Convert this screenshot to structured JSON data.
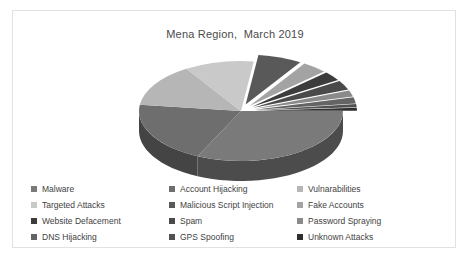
{
  "chart_data": {
    "type": "pie",
    "title": "Mena Region,  March 2019",
    "xlabel": "",
    "ylabel": "",
    "legend_position": "bottom",
    "three_d": true,
    "exploded": true,
    "categories": [
      "Malware",
      "Account Hijacking",
      "Vulnarabilities",
      "Targeted Attacks",
      "Malicious Script Injection",
      "Fake Accounts",
      "Website Defacement",
      "Spam",
      "Password Spraying",
      "DNS Hijacking",
      "GPS Spoofing",
      "Unknown Attacks"
    ],
    "values": [
      32,
      20,
      14,
      11,
      7,
      4,
      3,
      3,
      2,
      2,
      1,
      1
    ],
    "colors": [
      "#7a7a7a",
      "#6e6e6e",
      "#b6b6b6",
      "#c9c9c9",
      "#595959",
      "#a3a3a3",
      "#3c3c3c",
      "#4a4a4a",
      "#8a8a8a",
      "#646464",
      "#515151",
      "#2f2f2f"
    ]
  },
  "legend": {
    "items": [
      {
        "label": "Malware",
        "color": "#7a7a7a"
      },
      {
        "label": "Account Hijacking",
        "color": "#6e6e6e"
      },
      {
        "label": "Vulnarabilities",
        "color": "#b6b6b6"
      },
      {
        "label": "Targeted Attacks",
        "color": "#c9c9c9"
      },
      {
        "label": "Malicious Script Injection",
        "color": "#595959"
      },
      {
        "label": "Fake Accounts",
        "color": "#a3a3a3"
      },
      {
        "label": "Website Defacement",
        "color": "#3c3c3c"
      },
      {
        "label": "Spam",
        "color": "#4a4a4a"
      },
      {
        "label": "Password Spraying",
        "color": "#8a8a8a"
      },
      {
        "label": "DNS Hijacking",
        "color": "#646464"
      },
      {
        "label": "GPS Spoofing",
        "color": "#515151"
      },
      {
        "label": "Unknown Attacks",
        "color": "#2f2f2f"
      }
    ]
  },
  "card": {
    "border_color": "#e2e2e2",
    "background": "#ffffff"
  }
}
